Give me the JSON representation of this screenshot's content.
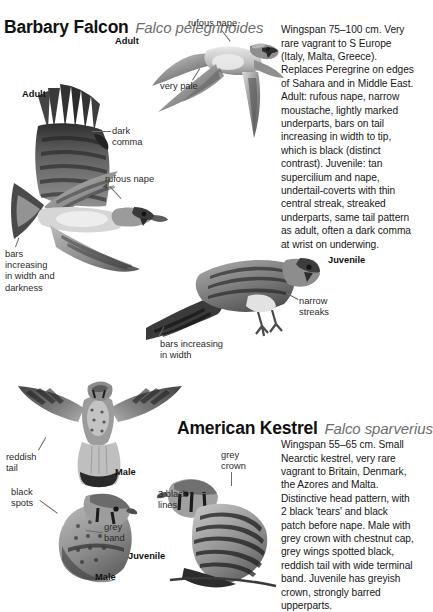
{
  "page": {
    "background": "#ffffff",
    "text_color": "#171717",
    "muted_color": "#6e6e6e"
  },
  "species": [
    {
      "id": "barbary-falcon",
      "common_name": "Barbary Falcon",
      "scientific_name": "Falco pelegrinoides",
      "description": "Wingspan 75–100 cm. Very rare vagrant to S Europe (Italy, Malta, Greece). Replaces Peregrine on edges of Sahara and in Middle East. Adult: rufous nape, narrow moustache, lightly marked underparts, bars on tail increasing in width to tip, which is black (distinct contrast). Juvenile: tan supercilium and nape, undertail-coverts with thin central streak, streaked underparts, same tail pattern as adult, often a dark comma at wrist on underwing."
    },
    {
      "id": "american-kestrel",
      "common_name": "American Kestrel",
      "scientific_name": "Falco sparverius",
      "description": "Wingspan 55–65 cm. Small Nearctic kestrel, very rare vagrant to Britain, Denmark, the Azores and Malta. Distinctive head pattern, with 2 black 'tears' and black patch before nape. Male with grey crown with chestnut cap, grey wings spotted black, reddish tail with wide terminal band. Juvenile has greyish crown, strongly barred upperparts."
    }
  ],
  "barbary_labels": {
    "rufous_nape_top": "rufous nape",
    "adult_flight": "Adult",
    "very_pale": "very pale",
    "adult_wing": "Adult",
    "dark_comma": "dark\ncomma",
    "rufous_nape_lower": "rufous nape",
    "bars_increasing_darkness": "bars\nincreasing\nin width and\ndarkness",
    "bars_increasing_width": "bars increasing\nin width",
    "juvenile": "Juvenile",
    "narrow_streaks": "narrow\nstreaks"
  },
  "kestrel_labels": {
    "reddish_tail": "reddish\ntail",
    "male_flight": "Male",
    "black_spots": "black\nspots",
    "grey_band": "grey\nband",
    "male_perched": "Male",
    "juvenile": "Juvenile",
    "grey_crown": "grey\ncrown",
    "three_black_lines": "3 black\nlines"
  }
}
